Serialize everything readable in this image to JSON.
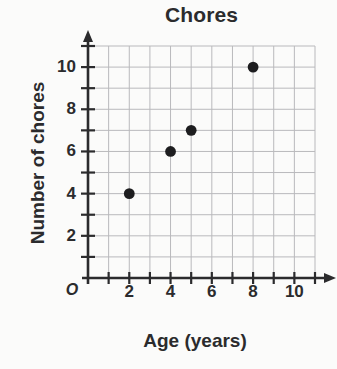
{
  "chart_data": {
    "type": "scatter",
    "title": "Chores",
    "xlabel": "Age (years)",
    "ylabel": "Number of chores",
    "origin_label": "O",
    "x": [
      2,
      4,
      5,
      8
    ],
    "values": [
      4,
      6,
      7,
      10
    ],
    "points": [
      {
        "x": 2,
        "y": 4
      },
      {
        "x": 4,
        "y": 6
      },
      {
        "x": 5,
        "y": 7
      },
      {
        "x": 8,
        "y": 10
      }
    ],
    "xlim": [
      0,
      11
    ],
    "ylim": [
      0,
      11
    ],
    "xticks": [
      2,
      4,
      6,
      8,
      10
    ],
    "yticks": [
      2,
      4,
      6,
      8,
      10
    ],
    "xtick_labels": [
      "2",
      "4",
      "6",
      "8",
      "10"
    ],
    "ytick_labels": [
      "2",
      "4",
      "6",
      "8",
      "10"
    ],
    "minor_tick_step": 1,
    "grid": true,
    "legend": false,
    "marker": "filled-circle",
    "marker_color": "#1d1d1f",
    "grid_color": "#b9b9bc",
    "axis_color": "#2b2b2d",
    "background_color": "#fbfbfa"
  }
}
